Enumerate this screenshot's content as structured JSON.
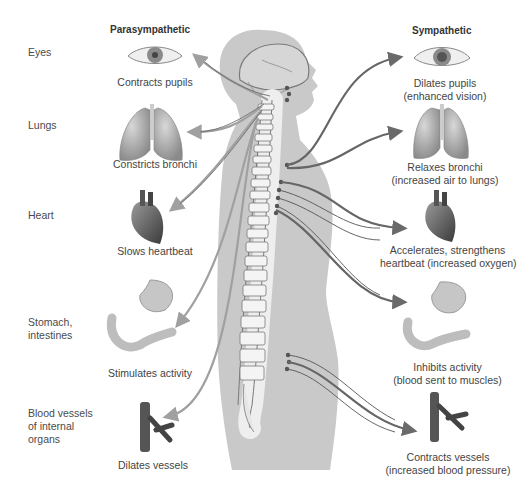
{
  "columns": {
    "left_header": "Parasympathetic",
    "right_header": "Sympathetic"
  },
  "rows": [
    {
      "organ": "Eyes",
      "icon": "eye-icon",
      "parasympathetic": [
        "Contracts pupils"
      ],
      "sympathetic": [
        "Dilates pupils",
        "(enhanced vision)"
      ]
    },
    {
      "organ": "Lungs",
      "icon": "lungs-icon",
      "parasympathetic": [
        "Constricts bronchi"
      ],
      "sympathetic": [
        "Relaxes bronchi",
        "(increased air to lungs)"
      ]
    },
    {
      "organ": "Heart",
      "icon": "heart-icon",
      "parasympathetic": [
        "Slows heartbeat"
      ],
      "sympathetic": [
        "Accelerates, strengthens",
        "heartbeat (increased oxygen)"
      ]
    },
    {
      "organ_lines": [
        "Stomach,",
        "intestines"
      ],
      "icon": "stomach-intestines-icon",
      "parasympathetic": [
        "Stimulates activity"
      ],
      "sympathetic": [
        "Inhibits activity",
        "(blood sent to muscles)"
      ]
    },
    {
      "organ_lines": [
        "Blood vessels",
        "of internal",
        "organs"
      ],
      "icon": "blood-vessels-icon",
      "parasympathetic": [
        "Dilates vessels"
      ],
      "sympathetic": [
        "Contracts vessels",
        "(increased blood pressure)"
      ]
    }
  ],
  "colors": {
    "body_silhouette": "#c9c9c9",
    "nerve_line": "#6e6e6e",
    "sympathetic_nerve": "#555555",
    "arrow_parasympathetic": "#9a9a9a",
    "arrow_sympathetic": "#707070",
    "vertebra": "#f0f0f0"
  }
}
